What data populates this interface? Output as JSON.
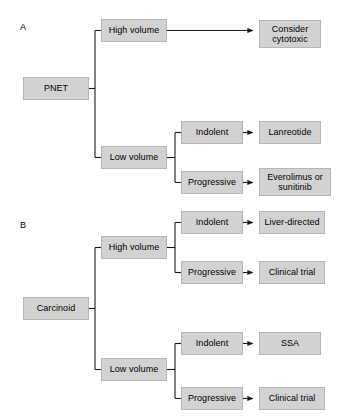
{
  "figure": {
    "width": 337,
    "height": 416,
    "background_color": "#ffffff",
    "node_fill_color": "#d2d2d2",
    "node_border_color": "#b6b6b6",
    "connector_color": "#1a1a1a",
    "text_color": "#000000",
    "type": "flowchart"
  },
  "panels": [
    {
      "id": "A",
      "label": "A",
      "label_x": 20,
      "label_y": 22,
      "root": {
        "name": "root-pnet",
        "text": "PNET",
        "x": 23,
        "y": 77,
        "w": 66,
        "h": 23
      },
      "branches": [
        {
          "name": "branch-high-volume",
          "text": "High volume",
          "x": 101,
          "y": 19,
          "w": 66,
          "h": 23,
          "children": [
            {
              "name": "outcome-consider-cytotoxic",
              "text": "Consider\ncytotoxic",
              "x": 259,
              "y": 20,
              "w": 62,
              "h": 28,
              "arrow_from_x": 167,
              "arrow_y": 31
            }
          ]
        },
        {
          "name": "branch-low-volume",
          "text": "Low volume",
          "x": 101,
          "y": 146,
          "w": 66,
          "h": 23,
          "children": [
            {
              "name": "modifier-indolent",
              "text": "Indolent",
              "x": 181,
              "y": 121,
              "w": 62,
              "h": 23,
              "outcome": {
                "name": "outcome-lanreotide",
                "text": "Lanreotide",
                "x": 259,
                "y": 121,
                "w": 62,
                "h": 23
              }
            },
            {
              "name": "modifier-progressive",
              "text": "Progressive",
              "x": 181,
              "y": 171,
              "w": 62,
              "h": 23,
              "outcome": {
                "name": "outcome-everolimus-or-sunitinib",
                "text": "Everolimus or\nsunitinib",
                "x": 259,
                "y": 168,
                "w": 72,
                "h": 28
              }
            }
          ]
        }
      ]
    },
    {
      "id": "B",
      "label": "B",
      "label_x": 20,
      "label_y": 220,
      "root": {
        "name": "root-carcinoid",
        "text": "Carcinoid",
        "x": 23,
        "y": 297,
        "w": 66,
        "h": 23
      },
      "branches": [
        {
          "name": "branch-high-volume",
          "text": "High volume",
          "x": 101,
          "y": 236,
          "w": 66,
          "h": 23,
          "children": [
            {
              "name": "modifier-indolent",
              "text": "Indolent",
              "x": 181,
              "y": 211,
              "w": 62,
              "h": 23,
              "outcome": {
                "name": "outcome-liver-directed",
                "text": "Liver-directed",
                "x": 259,
                "y": 211,
                "w": 66,
                "h": 23
              }
            },
            {
              "name": "modifier-progressive",
              "text": "Progressive",
              "x": 181,
              "y": 261,
              "w": 62,
              "h": 23,
              "outcome": {
                "name": "outcome-clinical-trial",
                "text": "Clinical trial",
                "x": 259,
                "y": 261,
                "w": 66,
                "h": 23
              }
            }
          ]
        },
        {
          "name": "branch-low-volume",
          "text": "Low volume",
          "x": 101,
          "y": 358,
          "w": 66,
          "h": 23,
          "children": [
            {
              "name": "modifier-indolent",
              "text": "Indolent",
              "x": 181,
              "y": 332,
              "w": 62,
              "h": 23,
              "outcome": {
                "name": "outcome-ssa",
                "text": "SSA",
                "x": 259,
                "y": 332,
                "w": 62,
                "h": 23
              }
            },
            {
              "name": "modifier-progressive",
              "text": "Progressive",
              "x": 181,
              "y": 387,
              "w": 62,
              "h": 23,
              "outcome": {
                "name": "outcome-clinical-trial",
                "text": "Clinical trial",
                "x": 259,
                "y": 387,
                "w": 66,
                "h": 23
              }
            }
          ]
        }
      ]
    }
  ],
  "chart_data": {
    "type": "tree-diagram",
    "title": "",
    "panels": [
      {
        "panel": "A",
        "root": "PNET",
        "edges": [
          {
            "from": "PNET",
            "to": "High volume"
          },
          {
            "from": "High volume",
            "to": "Consider cytotoxic"
          },
          {
            "from": "PNET",
            "to": "Low volume"
          },
          {
            "from": "Low volume",
            "to": "Indolent"
          },
          {
            "from": "Indolent",
            "to": "Lanreotide"
          },
          {
            "from": "Low volume",
            "to": "Progressive"
          },
          {
            "from": "Progressive",
            "to": "Everolimus or sunitinib"
          }
        ]
      },
      {
        "panel": "B",
        "root": "Carcinoid",
        "edges": [
          {
            "from": "Carcinoid",
            "to": "High volume"
          },
          {
            "from": "High volume",
            "to": "Indolent"
          },
          {
            "from": "Indolent",
            "to": "Liver-directed"
          },
          {
            "from": "High volume",
            "to": "Progressive"
          },
          {
            "from": "Progressive",
            "to": "Clinical trial"
          },
          {
            "from": "Carcinoid",
            "to": "Low volume"
          },
          {
            "from": "Low volume",
            "to": "Indolent"
          },
          {
            "from": "Indolent",
            "to": "SSA"
          },
          {
            "from": "Low volume",
            "to": "Progressive"
          },
          {
            "from": "Progressive",
            "to": "Clinical trial"
          }
        ]
      }
    ]
  }
}
